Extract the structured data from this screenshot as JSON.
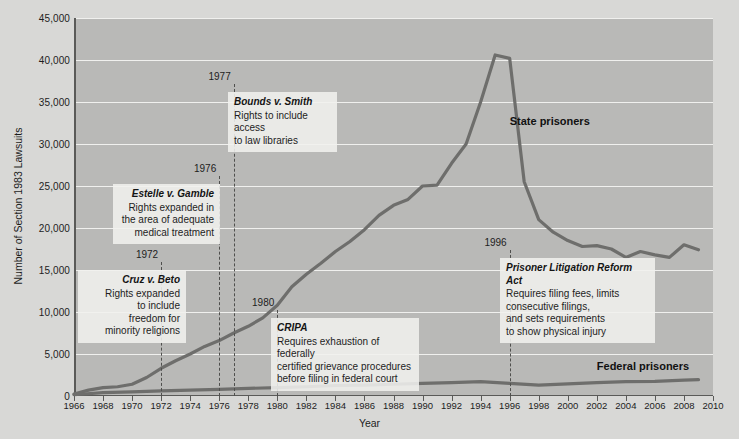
{
  "chart_data": {
    "type": "line",
    "title": "",
    "xlabel": "Year",
    "ylabel": "Number of Section 1983 Lawsuits",
    "xlim": [
      1966,
      2010
    ],
    "ylim": [
      0,
      45000
    ],
    "grid": true,
    "legend_position": "inline-labels",
    "y_ticks": [
      "0",
      "5,000",
      "10,000",
      "15,000",
      "20,000",
      "25,000",
      "30,000",
      "35,000",
      "40,000",
      "45,000"
    ],
    "y_tick_values": [
      0,
      5000,
      10000,
      15000,
      20000,
      25000,
      30000,
      35000,
      40000,
      45000
    ],
    "x_ticks": [
      "1966",
      "1968",
      "1970",
      "1972",
      "1974",
      "1976",
      "1978",
      "1980",
      "1982",
      "1984",
      "1986",
      "1988",
      "1990",
      "1992",
      "1994",
      "1996",
      "1998",
      "2000",
      "2002",
      "2004",
      "2006",
      "2008",
      "2010"
    ],
    "x_tick_values": [
      1966,
      1968,
      1970,
      1972,
      1974,
      1976,
      1978,
      1980,
      1982,
      1984,
      1986,
      1988,
      1990,
      1992,
      1994,
      1996,
      1998,
      2000,
      2002,
      2004,
      2006,
      2008,
      2010
    ],
    "series": [
      {
        "name": "State prisoners",
        "color": "#6e6e6c",
        "label_x": 1996,
        "label_y": 33500,
        "x": [
          1966,
          1967,
          1968,
          1969,
          1970,
          1971,
          1972,
          1973,
          1974,
          1975,
          1976,
          1977,
          1978,
          1979,
          1980,
          1981,
          1982,
          1983,
          1984,
          1985,
          1986,
          1987,
          1988,
          1989,
          1990,
          1991,
          1992,
          1993,
          1994,
          1995,
          1996,
          1997,
          1998,
          1999,
          2000,
          2001,
          2002,
          2003,
          2004,
          2005,
          2006,
          2007,
          2008,
          2009
        ],
        "values": [
          220,
          700,
          1000,
          1100,
          1400,
          2200,
          3300,
          4200,
          5000,
          5900,
          6600,
          7500,
          8300,
          9300,
          10800,
          13000,
          14500,
          15800,
          17200,
          18400,
          19800,
          21500,
          22700,
          23400,
          25000,
          25100,
          27700,
          30000,
          35000,
          40600,
          40200,
          25500,
          21000,
          19500,
          18500,
          17800,
          17900,
          17500,
          16500,
          17200,
          16800,
          16500,
          18000,
          17400
        ]
      },
      {
        "name": "Federal prisoners",
        "color": "#6e6e6c",
        "label_x": 2002,
        "label_y": 4300,
        "x": [
          1966,
          1968,
          1970,
          1972,
          1974,
          1976,
          1978,
          1980,
          1982,
          1984,
          1986,
          1988,
          1990,
          1992,
          1994,
          1996,
          1998,
          2000,
          2002,
          2004,
          2006,
          2008,
          2009
        ],
        "values": [
          150,
          400,
          500,
          600,
          700,
          800,
          900,
          1000,
          1100,
          1250,
          1300,
          1400,
          1500,
          1600,
          1700,
          1500,
          1300,
          1450,
          1600,
          1700,
          1750,
          1900,
          1950
        ]
      }
    ],
    "events": [
      {
        "year": 1972,
        "year_label": "1972",
        "title": "Cruz v. Beto",
        "body": "Rights expanded\nto include\nfreedom for\nminority religions",
        "align": "right",
        "box_left": 78,
        "box_top": 270,
        "box_width": 108,
        "line_top": 262,
        "line_bottom": 396
      },
      {
        "year": 1976,
        "year_label": "1976",
        "title": "Estelle v. Gamble",
        "body": "Rights expanded in\nthe area of adequate\nmedical treatment",
        "align": "right",
        "box_left": 113,
        "box_top": 184,
        "box_width": 107,
        "line_top": 176,
        "line_bottom": 396
      },
      {
        "year": 1977,
        "year_label": "1977",
        "title": "Bounds v. Smith",
        "body": "Rights to include access\nto law libraries",
        "align": "left",
        "box_left": 228,
        "box_top": 92,
        "box_width": 109,
        "line_top": 84,
        "line_bottom": 396
      },
      {
        "year": 1980,
        "year_label": "1980",
        "title": "CRIPA",
        "body": "Requires exhaustion of federally\ncertified grievance procedures\nbefore filing in federal court",
        "align": "left",
        "box_left": 271,
        "box_top": 318,
        "box_width": 148,
        "line_top": 310,
        "line_bottom": 396
      },
      {
        "year": 1996,
        "year_label": "1996",
        "title": "Prisoner Litigation Reform Act",
        "body": "Requires filing fees, limits\nconsecutive filings,\nand sets requirements\nto show physical injury",
        "align": "left",
        "box_left": 500,
        "box_top": 258,
        "box_width": 155,
        "line_top": 250,
        "line_bottom": 396
      }
    ]
  },
  "colors": {
    "page_background": "#d8d8d6",
    "plot_background": "#b9b9b7",
    "gridline": "#f0f0ee",
    "axis": "#5a5a58",
    "line": "#6e6e6c",
    "callout_background": "#f0f0ee",
    "text": "#1d1d1d"
  }
}
